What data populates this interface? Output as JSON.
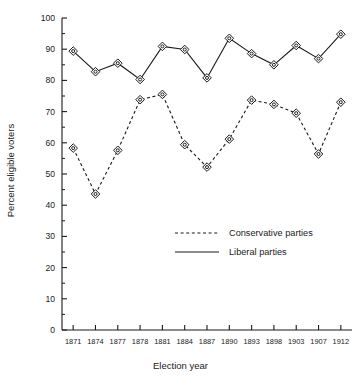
{
  "chart_data": {
    "type": "line",
    "title": "",
    "xlabel": "Election year",
    "ylabel": "Percent eligible voters",
    "categories": [
      "1871",
      "1874",
      "1877",
      "1878",
      "1881",
      "1884",
      "1887",
      "1890",
      "1893",
      "1898",
      "1903",
      "1907",
      "1912"
    ],
    "yticks": [
      0,
      10,
      20,
      30,
      40,
      50,
      60,
      70,
      80,
      90,
      100
    ],
    "ylim": [
      0,
      100
    ],
    "minor_tick_step": 5,
    "grid": false,
    "legend_position": "center-right",
    "marker": "diamond-with-dot",
    "series": [
      {
        "name": "Conservative parties",
        "style": "dashed",
        "color": "#1a1a1a",
        "values": [
          58.3,
          43.6,
          57.6,
          73.8,
          75.5,
          59.4,
          52.2,
          61.2,
          73.7,
          72.3,
          69.5,
          56.4,
          73.0
        ]
      },
      {
        "name": "Liberal parties",
        "style": "solid",
        "color": "#1a1a1a",
        "values": [
          89.4,
          82.8,
          85.5,
          80.3,
          90.9,
          89.9,
          80.8,
          93.5,
          88.6,
          85.0,
          91.2,
          87.0,
          94.8
        ]
      }
    ]
  },
  "legend": {
    "entries": [
      {
        "label": "Conservative parties",
        "style": "dashed"
      },
      {
        "label": "Liberal parties",
        "style": "solid"
      }
    ]
  }
}
